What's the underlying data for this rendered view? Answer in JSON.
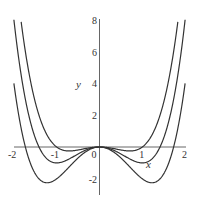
{
  "chart_data": {
    "type": "line",
    "title": "",
    "xlabel": "x",
    "ylabel": "y",
    "xlim": [
      -2,
      2
    ],
    "ylim": [
      -3,
      8
    ],
    "grid": false,
    "legend": "none",
    "x_ticks": [
      -2,
      -1,
      0,
      1,
      2
    ],
    "y_ticks": [
      -2,
      2,
      4,
      6,
      8
    ],
    "x_tick_labels": [
      "-2",
      "-1",
      "0",
      "1",
      "2"
    ],
    "y_tick_labels": [
      "-2",
      "2",
      "4",
      "6",
      "8"
    ],
    "series": [
      {
        "name": "y = x^4 - x^2",
        "c": 1,
        "min": -0.25,
        "points": [
          [
            -1.835,
            8
          ],
          [
            -1.5,
            2.81
          ],
          [
            -1,
            0
          ],
          [
            -0.707,
            -0.25
          ],
          [
            0,
            0
          ],
          [
            0.707,
            -0.25
          ],
          [
            1,
            0
          ],
          [
            1.5,
            2.81
          ],
          [
            1.835,
            8
          ]
        ]
      },
      {
        "name": "y = x^4 - 2x^2",
        "c": 2,
        "min": -1,
        "points": [
          [
            -2,
            8
          ],
          [
            -1.5,
            0.56
          ],
          [
            -1,
            -1
          ],
          [
            0,
            0
          ],
          [
            1,
            -1
          ],
          [
            1.5,
            0.56
          ],
          [
            2,
            8
          ]
        ]
      },
      {
        "name": "y = x^4 - 3x^2",
        "c": 3,
        "min": -2.25,
        "points": [
          [
            -2,
            4
          ],
          [
            -1.5,
            -1.69
          ],
          [
            -1.225,
            -2.25
          ],
          [
            0,
            0
          ],
          [
            1.225,
            -2.25
          ],
          [
            1.5,
            -1.69
          ],
          [
            2,
            4
          ]
        ]
      }
    ]
  },
  "axes": {
    "x_label": "x",
    "y_label": "y",
    "x_ticks": [
      "-2",
      "-1",
      "0",
      "1",
      "2"
    ],
    "y_ticks": [
      "8",
      "6",
      "4",
      "2",
      "-2"
    ]
  },
  "colors": {
    "curve": "#333333",
    "axis": "#555555",
    "background": "#ffffff"
  }
}
